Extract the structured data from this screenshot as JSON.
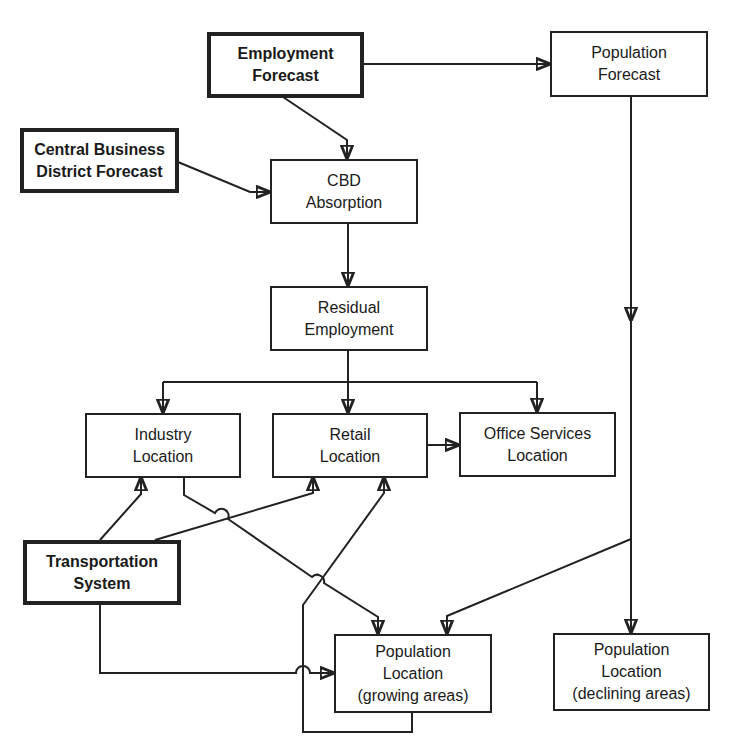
{
  "diagram": {
    "type": "flowchart",
    "nodes": {
      "employment_forecast": {
        "line1": "Employment",
        "line2": "Forecast",
        "style": "thick"
      },
      "population_forecast": {
        "line1": "Population",
        "line2": "Forecast",
        "style": "normal"
      },
      "cbd_forecast": {
        "line1": "Central Business",
        "line2": "District Forecast",
        "style": "thick"
      },
      "cbd_absorption": {
        "line1": "CBD",
        "line2": "Absorption",
        "style": "normal"
      },
      "residual_employment": {
        "line1": "Residual",
        "line2": "Employment",
        "style": "normal"
      },
      "industry_location": {
        "line1": "Industry",
        "line2": "Location",
        "style": "normal"
      },
      "retail_location": {
        "line1": "Retail",
        "line2": "Location",
        "style": "normal"
      },
      "office_services_location": {
        "line1": "Office Services",
        "line2": "Location",
        "style": "normal"
      },
      "transportation_system": {
        "line1": "Transportation",
        "line2": "System",
        "style": "thick"
      },
      "population_location_growing": {
        "line1": "Population",
        "line2": "Location",
        "line3": "(growing areas)",
        "style": "normal"
      },
      "population_location_declining": {
        "line1": "Population",
        "line2": "Location",
        "line3": "(declining areas)",
        "style": "normal"
      }
    },
    "edges": [
      {
        "from": "employment_forecast",
        "to": "population_forecast"
      },
      {
        "from": "employment_forecast",
        "to": "cbd_absorption"
      },
      {
        "from": "cbd_forecast",
        "to": "cbd_absorption"
      },
      {
        "from": "cbd_absorption",
        "to": "residual_employment"
      },
      {
        "from": "residual_employment",
        "to": "industry_location"
      },
      {
        "from": "residual_employment",
        "to": "retail_location"
      },
      {
        "from": "residual_employment",
        "to": "office_services_location"
      },
      {
        "from": "retail_location",
        "to": "office_services_location"
      },
      {
        "from": "transportation_system",
        "to": "industry_location"
      },
      {
        "from": "transportation_system",
        "to": "retail_location"
      },
      {
        "from": "transportation_system",
        "to": "population_location_growing"
      },
      {
        "from": "industry_location",
        "to": "population_location_growing"
      },
      {
        "from": "population_location_growing",
        "to": "retail_location"
      },
      {
        "from": "population_forecast",
        "to": "population_location_growing"
      },
      {
        "from": "population_forecast",
        "to": "population_location_declining"
      }
    ],
    "colors": {
      "ink": "#222222",
      "background": "#ffffff"
    }
  }
}
